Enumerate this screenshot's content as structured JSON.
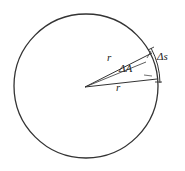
{
  "figure": {
    "background_color": "#ffffff",
    "stroke_color": "#333333",
    "text_color": "#222222",
    "labels": {
      "radius_upper": "r",
      "radius_lower": "r",
      "central_angle": "ΔA",
      "arc_length": "Δs"
    },
    "geometry": {
      "circle": {
        "center_x": 86,
        "center_y": 86,
        "radius": 72,
        "left_edge_x": 14,
        "right_edge_x": 158,
        "top_edge_y": 14,
        "bottom_edge_y": 158
      },
      "sector": {
        "vertex_x": 85,
        "vertex_y": 87,
        "upper_ray_end_x": 150,
        "upper_ray_end_y": 55,
        "lower_ray_end_x": 155,
        "lower_ray_end_y": 78,
        "angle_degrees": 24
      },
      "arc_marker": {
        "description": "arc drawn just outside the circle spanning the sector",
        "start_x": 152,
        "start_y": 52,
        "end_x": 158,
        "end_y": 80
      }
    }
  }
}
